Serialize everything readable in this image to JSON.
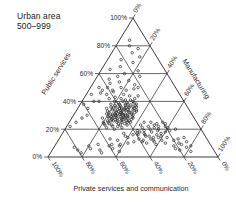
{
  "figure": {
    "title_lines": [
      "Urban area",
      "500–999"
    ]
  },
  "chart_data": {
    "type": "scatter",
    "subtype": "ternary",
    "title": "Urban area 500–999",
    "marker": "open-circle",
    "grid": true,
    "grid_step_pct": 20,
    "colors": {
      "ink": "#262626",
      "background": "#ffffff"
    },
    "axes": {
      "left": {
        "title": "Public services",
        "tick_values": [
          0,
          20,
          40,
          60,
          80,
          100
        ],
        "tick_labels": [
          "0%",
          "20%",
          "40%",
          "60%",
          "80%",
          "100%"
        ]
      },
      "right": {
        "title": "Manufacturing",
        "tick_values": [
          0,
          20,
          40,
          60,
          80,
          100
        ],
        "tick_labels": [
          "0%",
          "20%",
          "40%",
          "60%",
          "80%",
          "100%"
        ]
      },
      "bottom": {
        "title": "Private services and communication",
        "tick_values": [
          0,
          20,
          40,
          60,
          80,
          100
        ],
        "tick_labels": [
          "0%",
          "20%",
          "40%",
          "60%",
          "80%",
          "100%"
        ]
      }
    },
    "point_format": [
      "public_services_pct",
      "manufacturing_pct"
    ],
    "points": [
      [
        33,
        25
      ],
      [
        35.5,
        28
      ],
      [
        30,
        30.5
      ],
      [
        28,
        24
      ],
      [
        36,
        22
      ],
      [
        31.5,
        27
      ],
      [
        27,
        31
      ],
      [
        34,
        33
      ],
      [
        38,
        26.5
      ],
      [
        29,
        21
      ],
      [
        25,
        28
      ],
      [
        32,
        35
      ],
      [
        37.5,
        30
      ],
      [
        40,
        24
      ],
      [
        26,
        25.5
      ],
      [
        31,
        19
      ],
      [
        35,
        17
      ],
      [
        28,
        36
      ],
      [
        24,
        33
      ],
      [
        33.5,
        29
      ],
      [
        30,
        23
      ],
      [
        27.5,
        27
      ],
      [
        36,
        34
      ],
      [
        41,
        28
      ],
      [
        23,
        26
      ],
      [
        29,
        32.5
      ],
      [
        34,
        21
      ],
      [
        38,
        18
      ],
      [
        25,
        36
      ],
      [
        31,
        33.5
      ],
      [
        28,
        29
      ],
      [
        35,
        24.5
      ],
      [
        32,
        27
      ],
      [
        26,
        22
      ],
      [
        39,
        31
      ],
      [
        42,
        22
      ],
      [
        24,
        29.5
      ],
      [
        30,
        35
      ],
      [
        33,
        18.5
      ],
      [
        37,
        27
      ],
      [
        29.5,
        25
      ],
      [
        26,
        33
      ],
      [
        34,
        30
      ],
      [
        31,
        22.5
      ],
      [
        28,
        18
      ],
      [
        36,
        25
      ],
      [
        40,
        19
      ],
      [
        23,
        31
      ],
      [
        27,
        24
      ],
      [
        32,
        31.5
      ],
      [
        35,
        33
      ],
      [
        30.5,
        27
      ],
      [
        25,
        20
      ],
      [
        38,
        23
      ],
      [
        33,
        35.5
      ],
      [
        29,
        28
      ],
      [
        26,
        30
      ],
      [
        41,
        25
      ],
      [
        31,
        30
      ],
      [
        34.5,
        26
      ],
      [
        28,
        33
      ],
      [
        36,
        29.5
      ],
      [
        24,
        24
      ],
      [
        32,
        20
      ],
      [
        30,
        32
      ],
      [
        27,
        35.5
      ],
      [
        35,
        21
      ],
      [
        39,
        27
      ],
      [
        25,
        31
      ],
      [
        33,
        23
      ],
      [
        29,
        35
      ],
      [
        31,
        25.5
      ],
      [
        37,
        24
      ],
      [
        26,
        28
      ],
      [
        34,
        35
      ],
      [
        28.5,
        26
      ],
      [
        42,
        30
      ],
      [
        23,
        22
      ],
      [
        30,
        25
      ],
      [
        36,
        32
      ],
      [
        32,
        24
      ],
      [
        27,
        30
      ],
      [
        35,
        27.5
      ],
      [
        29,
        23
      ],
      [
        33,
        31
      ],
      [
        25,
        34
      ],
      [
        38,
        28
      ],
      [
        31,
        28
      ],
      [
        28,
        22
      ],
      [
        34,
        24
      ],
      [
        44,
        26
      ],
      [
        22,
        27
      ],
      [
        30,
        29
      ],
      [
        37,
        21
      ],
      [
        26,
        35
      ],
      [
        33,
        27
      ],
      [
        29,
        30
      ],
      [
        35.5,
        30
      ],
      [
        31,
        24
      ],
      [
        27,
        26
      ],
      [
        24,
        21
      ],
      [
        40,
        30
      ],
      [
        32,
        33
      ],
      [
        28,
        31
      ],
      [
        36,
        19
      ],
      [
        30,
        21
      ],
      [
        34,
        28
      ],
      [
        26,
        24
      ],
      [
        38,
        33
      ],
      [
        22,
        30
      ],
      [
        45,
        22
      ],
      [
        43,
        18
      ],
      [
        21,
        24
      ],
      [
        20,
        29
      ],
      [
        23,
        35
      ],
      [
        44,
        31
      ],
      [
        39,
        22
      ],
      [
        25,
        23
      ],
      [
        37,
        33
      ],
      [
        21,
        33
      ],
      [
        18,
        45
      ],
      [
        22,
        48
      ],
      [
        15,
        52
      ],
      [
        20,
        55
      ],
      [
        25,
        44
      ],
      [
        12,
        50
      ],
      [
        17,
        58
      ],
      [
        23,
        51
      ],
      [
        19,
        47
      ],
      [
        14,
        55
      ],
      [
        21,
        60
      ],
      [
        16,
        49
      ],
      [
        24,
        57
      ],
      [
        10,
        53
      ],
      [
        19,
        62
      ],
      [
        13,
        47
      ],
      [
        22,
        54
      ],
      [
        17,
        44
      ],
      [
        15,
        59
      ],
      [
        20,
        50
      ],
      [
        11,
        57
      ],
      [
        18,
        52
      ],
      [
        25,
        48
      ],
      [
        14,
        63
      ],
      [
        21,
        45
      ],
      [
        16,
        56
      ],
      [
        12,
        61
      ],
      [
        23,
        43
      ],
      [
        19,
        55
      ],
      [
        15,
        50
      ],
      [
        9,
        59
      ],
      [
        20,
        65
      ],
      [
        17,
        48
      ],
      [
        13,
        54
      ],
      [
        24,
        52
      ],
      [
        18,
        60
      ],
      [
        11,
        50
      ],
      [
        22,
        58
      ],
      [
        16,
        45
      ],
      [
        14,
        58
      ],
      [
        10,
        64
      ],
      [
        19,
        43
      ],
      [
        21,
        52
      ],
      [
        12,
        56
      ],
      [
        25,
        55
      ],
      [
        12,
        35
      ],
      [
        15,
        38
      ],
      [
        10,
        42
      ],
      [
        8,
        32
      ],
      [
        14,
        40
      ],
      [
        17,
        36
      ],
      [
        11,
        45
      ],
      [
        13,
        30
      ],
      [
        16,
        42
      ],
      [
        9,
        38
      ],
      [
        8,
        70
      ],
      [
        12,
        68
      ],
      [
        5,
        75
      ],
      [
        10,
        72
      ],
      [
        7,
        78
      ],
      [
        13,
        70
      ],
      [
        4,
        82
      ],
      [
        9,
        74
      ],
      [
        11,
        76
      ],
      [
        6,
        72
      ],
      [
        8,
        80
      ],
      [
        14,
        73
      ],
      [
        55,
        20
      ],
      [
        60,
        15
      ],
      [
        65,
        10
      ],
      [
        58,
        12
      ],
      [
        70,
        8
      ],
      [
        62,
        22
      ],
      [
        75,
        12
      ],
      [
        80,
        8
      ],
      [
        68,
        16
      ],
      [
        56,
        8
      ],
      [
        72,
        18
      ],
      [
        63,
        5
      ],
      [
        58,
        25
      ],
      [
        78,
        14
      ],
      [
        84,
        6
      ],
      [
        50,
        18
      ],
      [
        52,
        25
      ],
      [
        48,
        22
      ],
      [
        54,
        15
      ],
      [
        50,
        28
      ],
      [
        47,
        15
      ],
      [
        53,
        10
      ],
      [
        49,
        26
      ],
      [
        25,
        4
      ],
      [
        35,
        6
      ],
      [
        45,
        3
      ],
      [
        30,
        8
      ],
      [
        50,
        5
      ],
      [
        40,
        7
      ],
      [
        22,
        2
      ],
      [
        48,
        8
      ],
      [
        38,
        2
      ],
      [
        28,
        6
      ],
      [
        5,
        15
      ],
      [
        8,
        20
      ],
      [
        3,
        30
      ],
      [
        6,
        35
      ],
      [
        9,
        25
      ],
      [
        4,
        40
      ],
      [
        7,
        12
      ],
      [
        5,
        28
      ],
      [
        8,
        38
      ],
      [
        3,
        18
      ],
      [
        6,
        22
      ],
      [
        9,
        33
      ],
      [
        45,
        12
      ],
      [
        50,
        10
      ],
      [
        42,
        15
      ],
      [
        48,
        14
      ],
      [
        40,
        10
      ],
      [
        46,
        8
      ]
    ]
  }
}
